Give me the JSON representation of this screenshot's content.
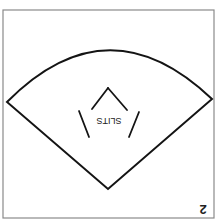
{
  "diagram": {
    "type": "sewing-pattern-piece",
    "orientation": "rotated 180 degrees",
    "piece_number": "2",
    "shape": "circular-sector",
    "slit_label": "SLITS",
    "slit_count": 4,
    "colors": {
      "background": "#ffffff",
      "frame": "#8a8a8a",
      "outline": "#141414",
      "text": "#222222"
    }
  }
}
